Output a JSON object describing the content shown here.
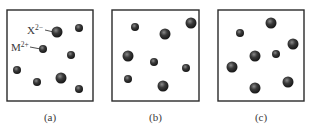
{
  "figure": {
    "panels": [
      {
        "id": "a",
        "caption": "(a)",
        "box": {
          "x": 7,
          "y": 10,
          "w": 86,
          "h": 91
        },
        "annotations": [
          {
            "text": "X",
            "sup": "2−",
            "x": 27,
            "y": 34,
            "target": 0
          },
          {
            "text": "M",
            "sup": "2+",
            "x": 11,
            "y": 51,
            "target": 2
          }
        ],
        "ions": [
          {
            "x": 57,
            "y": 32,
            "r": 5.5,
            "type": "large"
          },
          {
            "x": 79,
            "y": 28,
            "r": 4,
            "type": "small"
          },
          {
            "x": 43,
            "y": 49,
            "r": 4,
            "type": "small"
          },
          {
            "x": 71,
            "y": 55,
            "r": 4,
            "type": "small"
          },
          {
            "x": 17,
            "y": 70,
            "r": 4,
            "type": "small"
          },
          {
            "x": 37,
            "y": 82,
            "r": 4,
            "type": "small"
          },
          {
            "x": 61,
            "y": 78,
            "r": 5.5,
            "type": "large"
          },
          {
            "x": 79,
            "y": 89,
            "r": 4,
            "type": "small"
          }
        ]
      },
      {
        "id": "b",
        "caption": "(b)",
        "box": {
          "x": 112,
          "y": 10,
          "w": 87,
          "h": 91
        },
        "annotations": [],
        "ions": [
          {
            "x": 135,
            "y": 27,
            "r": 4,
            "type": "small"
          },
          {
            "x": 165,
            "y": 34,
            "r": 5.5,
            "type": "large"
          },
          {
            "x": 191,
            "y": 23,
            "r": 5.5,
            "type": "large"
          },
          {
            "x": 128,
            "y": 56,
            "r": 5.5,
            "type": "large"
          },
          {
            "x": 154,
            "y": 62,
            "r": 4,
            "type": "small"
          },
          {
            "x": 186,
            "y": 68,
            "r": 4,
            "type": "small"
          },
          {
            "x": 128,
            "y": 79,
            "r": 4,
            "type": "small"
          },
          {
            "x": 163,
            "y": 86,
            "r": 5.5,
            "type": "large"
          }
        ]
      },
      {
        "id": "c",
        "caption": "(c)",
        "box": {
          "x": 218,
          "y": 10,
          "w": 86,
          "h": 91
        },
        "annotations": [],
        "ions": [
          {
            "x": 271,
            "y": 23,
            "r": 5.5,
            "type": "large"
          },
          {
            "x": 240,
            "y": 33,
            "r": 4,
            "type": "small"
          },
          {
            "x": 293,
            "y": 44,
            "r": 5.5,
            "type": "large"
          },
          {
            "x": 255,
            "y": 56,
            "r": 5.5,
            "type": "large"
          },
          {
            "x": 276,
            "y": 54,
            "r": 4,
            "type": "small"
          },
          {
            "x": 232,
            "y": 67,
            "r": 5.5,
            "type": "large"
          },
          {
            "x": 288,
            "y": 82,
            "r": 5.5,
            "type": "large"
          },
          {
            "x": 255,
            "y": 88,
            "r": 5.5,
            "type": "large"
          }
        ]
      }
    ],
    "colors": {
      "box_stroke": "#2a2a2a",
      "ion_dark": "#1c1c1c",
      "ion_mid": "#4a4a4a",
      "ion_highlight": "#8a8a8a",
      "text": "#3a3a3a"
    }
  }
}
